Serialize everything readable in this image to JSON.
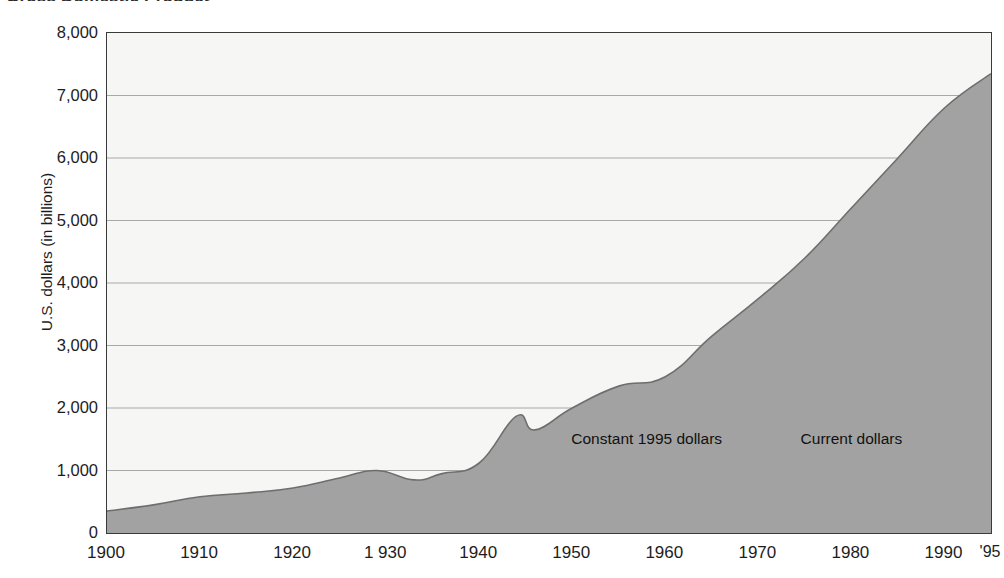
{
  "chart_data": {
    "type": "area",
    "title": "Gross Domestic Product",
    "xlabel": "",
    "ylabel": "U.S. dollars (in billions)",
    "xlim": [
      1900,
      1995
    ],
    "ylim": [
      0,
      8000
    ],
    "grid": true,
    "legend_position": "inline-annotations",
    "annotations": [
      {
        "text": "Constant 1995 dollars",
        "x": 1958,
        "y": 1500
      },
      {
        "text": "Current dollars",
        "x": 1980,
        "y": 1500
      }
    ],
    "y_ticks": [
      "0",
      "1,000",
      "2,000",
      "3,000",
      "4,000",
      "5,000",
      "6,000",
      "7,000",
      "8,000"
    ],
    "y_tick_values": [
      0,
      1000,
      2000,
      3000,
      4000,
      5000,
      6000,
      7000,
      8000
    ],
    "x_ticks": [
      "1900",
      "1910",
      "1920",
      "1 930",
      "1940",
      "1950",
      "1960",
      "1970",
      "1980",
      "1990",
      "'95"
    ],
    "x_tick_values": [
      1900,
      1910,
      1920,
      1930,
      1940,
      1950,
      1960,
      1970,
      1980,
      1990,
      1995
    ],
    "series": [
      {
        "name": "Gross Domestic Product",
        "x": [
          1900,
          1905,
          1910,
          1915,
          1920,
          1925,
          1929,
          1933,
          1936,
          1940,
          1944,
          1946,
          1950,
          1955,
          1960,
          1965,
          1970,
          1975,
          1980,
          1985,
          1990,
          1995
        ],
        "values": [
          350,
          450,
          580,
          640,
          720,
          880,
          1000,
          850,
          950,
          1120,
          1870,
          1650,
          2000,
          2350,
          2500,
          3150,
          3750,
          4400,
          5200,
          6000,
          6800,
          7350
        ]
      }
    ],
    "colors": {
      "fill": "#a2a2a2",
      "line": "#6e6e6e",
      "plot_background": "#f6f6f5",
      "grid": "#a8a8a8",
      "frame": "#3a3a3a",
      "text": "#1d1d1d"
    }
  }
}
